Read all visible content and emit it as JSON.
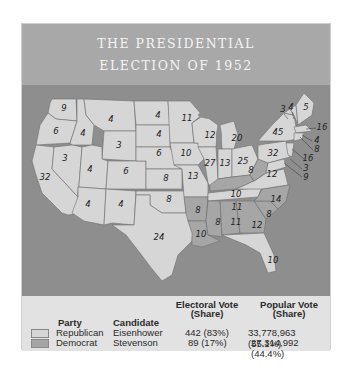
{
  "title": {
    "line1": "THE PRESIDENTIAL",
    "line2": "ELECTION OF 1952"
  },
  "colors": {
    "title_band": "#a8a8a8",
    "ocean": "#8e8e8e",
    "republican_fill": "#d6d6d6",
    "democrat_fill": "#a6a6a6",
    "panel_bg": "#e2e2e2"
  },
  "map": {
    "states": [
      {
        "abbr": "WA",
        "ev": "9",
        "party": "Republican"
      },
      {
        "abbr": "OR",
        "ev": "6",
        "party": "Republican"
      },
      {
        "abbr": "CA",
        "ev": "32",
        "party": "Republican"
      },
      {
        "abbr": "ID",
        "ev": "4",
        "party": "Republican"
      },
      {
        "abbr": "NV",
        "ev": "3",
        "party": "Republican"
      },
      {
        "abbr": "MT",
        "ev": "4",
        "party": "Republican"
      },
      {
        "abbr": "WY",
        "ev": "3",
        "party": "Republican"
      },
      {
        "abbr": "UT",
        "ev": "4",
        "party": "Republican"
      },
      {
        "abbr": "CO",
        "ev": "6",
        "party": "Republican"
      },
      {
        "abbr": "AZ",
        "ev": "4",
        "party": "Republican"
      },
      {
        "abbr": "NM",
        "ev": "4",
        "party": "Republican"
      },
      {
        "abbr": "ND",
        "ev": "4",
        "party": "Republican"
      },
      {
        "abbr": "SD",
        "ev": "4",
        "party": "Republican"
      },
      {
        "abbr": "NE",
        "ev": "6",
        "party": "Republican"
      },
      {
        "abbr": "KS",
        "ev": "8",
        "party": "Republican"
      },
      {
        "abbr": "OK",
        "ev": "8",
        "party": "Republican"
      },
      {
        "abbr": "TX",
        "ev": "24",
        "party": "Republican"
      },
      {
        "abbr": "MN",
        "ev": "11",
        "party": "Republican"
      },
      {
        "abbr": "IA",
        "ev": "10",
        "party": "Republican"
      },
      {
        "abbr": "MO",
        "ev": "13",
        "party": "Republican"
      },
      {
        "abbr": "AR",
        "ev": "8",
        "party": "Democrat"
      },
      {
        "abbr": "LA",
        "ev": "10",
        "party": "Democrat"
      },
      {
        "abbr": "WI",
        "ev": "12",
        "party": "Republican"
      },
      {
        "abbr": "IL",
        "ev": "27",
        "party": "Republican"
      },
      {
        "abbr": "MI",
        "ev": "20",
        "party": "Republican"
      },
      {
        "abbr": "IN",
        "ev": "13",
        "party": "Republican"
      },
      {
        "abbr": "OH",
        "ev": "25",
        "party": "Republican"
      },
      {
        "abbr": "KY",
        "ev": "10",
        "party": "Democrat"
      },
      {
        "abbr": "TN",
        "ev": "11",
        "party": "Republican"
      },
      {
        "abbr": "MS",
        "ev": "8",
        "party": "Democrat"
      },
      {
        "abbr": "AL",
        "ev": "11",
        "party": "Democrat"
      },
      {
        "abbr": "GA",
        "ev": "12",
        "party": "Democrat"
      },
      {
        "abbr": "FL",
        "ev": "10",
        "party": "Republican"
      },
      {
        "abbr": "SC",
        "ev": "8",
        "party": "Democrat"
      },
      {
        "abbr": "NC",
        "ev": "14",
        "party": "Democrat"
      },
      {
        "abbr": "VA",
        "ev": "12",
        "party": "Republican"
      },
      {
        "abbr": "WV",
        "ev": "8",
        "party": "Democrat"
      },
      {
        "abbr": "PA",
        "ev": "32",
        "party": "Republican"
      },
      {
        "abbr": "NY",
        "ev": "45",
        "party": "Republican"
      },
      {
        "abbr": "VT",
        "ev": "3",
        "party": "Republican"
      },
      {
        "abbr": "NH",
        "ev": "4",
        "party": "Republican"
      },
      {
        "abbr": "ME",
        "ev": "5",
        "party": "Republican"
      },
      {
        "abbr": "MA",
        "ev": "16",
        "party": "Republican"
      },
      {
        "abbr": "RI",
        "ev": "4",
        "party": "Republican"
      },
      {
        "abbr": "CT",
        "ev": "8",
        "party": "Republican"
      },
      {
        "abbr": "NJ",
        "ev": "16",
        "party": "Republican"
      },
      {
        "abbr": "DE",
        "ev": "3",
        "party": "Republican"
      },
      {
        "abbr": "MD",
        "ev": "9",
        "party": "Republican"
      }
    ]
  },
  "legend": {
    "headers": {
      "party": "Party",
      "candidate": "Candidate",
      "electoral_line1": "Electoral Vote",
      "electoral_line2": "(Share)",
      "popular_line1": "Popular Vote",
      "popular_line2": "(Share)"
    },
    "rows": [
      {
        "party": "Republican",
        "candidate": "Eisenhower",
        "electoral": "442 (83%)",
        "popular": "33,778,963 (55.1%)",
        "color": "#d6d6d6"
      },
      {
        "party": "Democrat",
        "candidate": "Stevenson",
        "electoral": "89 (17%)",
        "popular": "27,314,992 (44.4%)",
        "color": "#a6a6a6"
      }
    ]
  }
}
